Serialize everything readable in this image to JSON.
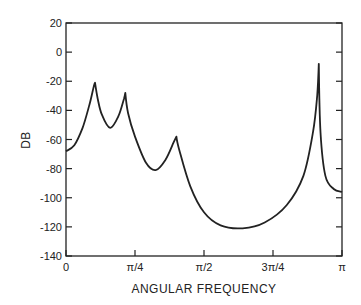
{
  "chart_data": {
    "type": "line",
    "title": "",
    "xlabel": "ANGULAR FREQUENCY",
    "ylabel": "DB",
    "xlim": [
      0,
      3.14159
    ],
    "ylim": [
      -140,
      20
    ],
    "grid": false,
    "legend": null,
    "y_ticks": [
      20,
      0,
      -20,
      -40,
      -60,
      -80,
      -100,
      -120,
      -140
    ],
    "y_tick_labels": [
      "20",
      "0",
      "-20",
      "-40",
      "-60",
      "-80",
      "-100",
      "-120",
      "-140"
    ],
    "x_ticks": [
      0,
      0.7854,
      1.5708,
      2.3562,
      3.14159
    ],
    "x_tick_labels": [
      "0",
      "π/4",
      "π/2",
      "3π/4",
      "π"
    ],
    "series": [
      {
        "name": "magnitude response",
        "x_over_pi": [
          0.0,
          0.03,
          0.06,
          0.085,
          0.1,
          0.105,
          0.115,
          0.13,
          0.16,
          0.19,
          0.21,
          0.215,
          0.225,
          0.25,
          0.29,
          0.325,
          0.36,
          0.39,
          0.4,
          0.41,
          0.45,
          0.5,
          0.56,
          0.64,
          0.72,
          0.8,
          0.86,
          0.895,
          0.91,
          0.916,
          0.922,
          0.94,
          0.97,
          1.0
        ],
        "db": [
          -68,
          -64,
          -52,
          -36,
          -24,
          -21,
          -32,
          -43,
          -52,
          -44,
          -32,
          -28,
          -42,
          -58,
          -76,
          -81,
          -74,
          -62,
          -58,
          -67,
          -92,
          -110,
          -119,
          -121,
          -117,
          -105,
          -85,
          -55,
          -30,
          -8,
          -55,
          -85,
          -94,
          -96
        ]
      }
    ],
    "peaks": [
      {
        "x_over_pi": 0.105,
        "db": -21
      },
      {
        "x_over_pi": 0.215,
        "db": -28
      },
      {
        "x_over_pi": 0.4,
        "db": -58
      },
      {
        "x_over_pi": 0.916,
        "db": -8
      }
    ]
  }
}
